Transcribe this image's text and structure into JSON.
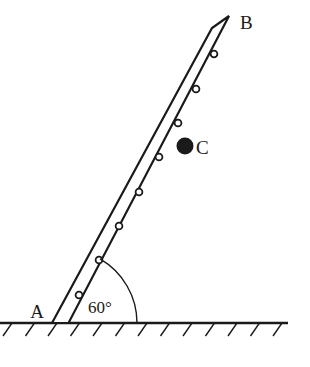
{
  "figure": {
    "background_color": "#ffffff",
    "stroke_color": "#1a1a1a",
    "fill_color": "#ffffff",
    "width": 310,
    "height": 367
  },
  "labels": {
    "base_point": "A",
    "top_point": "B",
    "mass_point": "C",
    "angle": "60°"
  },
  "ladder": {
    "base_left": {
      "x": 52,
      "y": 323
    },
    "base_right": {
      "x": 68.5,
      "y": 323
    },
    "top_left": {
      "x": 212,
      "y": 28
    },
    "top_right": {
      "x": 229,
      "y": 16
    },
    "angle_degrees": 60,
    "width_px": 15,
    "stroke_width": 2.2
  },
  "rungs": {
    "radius": 3.4,
    "stroke_width": 1.8,
    "fill": "#ffffff",
    "points": [
      {
        "x": 79,
        "y": 295
      },
      {
        "x": 99,
        "y": 260
      },
      {
        "x": 119,
        "y": 226
      },
      {
        "x": 139,
        "y": 192
      },
      {
        "x": 159,
        "y": 157
      },
      {
        "x": 178,
        "y": 123
      },
      {
        "x": 196,
        "y": 89
      },
      {
        "x": 214,
        "y": 54
      }
    ]
  },
  "mass_marker": {
    "x": 185,
    "y": 146,
    "radius": 8.5,
    "fill": "#1a1a1a"
  },
  "angle_arc": {
    "center": {
      "x": 63,
      "y": 323
    },
    "radius": 74,
    "start_degrees": 0,
    "end_degrees": 60,
    "stroke_width": 1.4
  },
  "ground": {
    "y": 323,
    "x_start": 0,
    "x_end": 288,
    "stroke_width": 2.4,
    "hatch": {
      "count": 13,
      "spacing": 22.5,
      "first_x": 3,
      "length": 15,
      "dx": 9,
      "dy": 13,
      "stroke_width": 1.4
    }
  },
  "label_positions": {
    "A": {
      "x": 37,
      "y": 318
    },
    "B": {
      "x": 240,
      "y": 29
    },
    "C": {
      "x": 196,
      "y": 154
    },
    "angle": {
      "x": 88,
      "y": 313
    }
  }
}
